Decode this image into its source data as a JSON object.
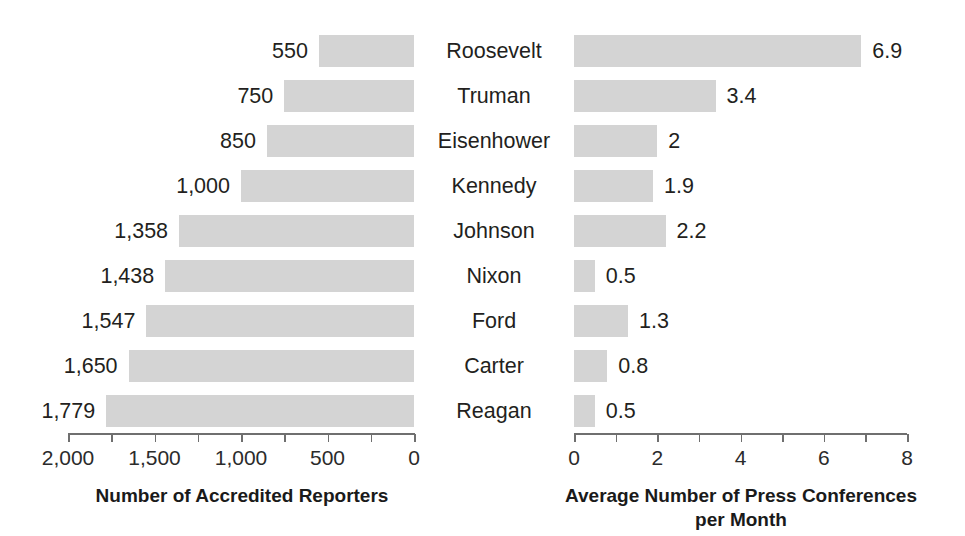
{
  "chart_data": {
    "type": "bar",
    "title": "",
    "orientation": "horizontal",
    "layout": "back-to-back butterfly / tornado, two panels sharing centered category labels",
    "categories": [
      "Roosevelt",
      "Truman",
      "Eisenhower",
      "Kennedy",
      "Johnson",
      "Nixon",
      "Ford",
      "Carter",
      "Reagan"
    ],
    "grid": false,
    "legend": null,
    "bar_color": "#d4d4d4",
    "axis_color": "#6f6f6f",
    "text_color": "#231f20",
    "panels": [
      {
        "id": "accredited-reporters",
        "side": "left",
        "xlabel": "Number of Accredited Reporters",
        "direction": "right-to-left",
        "xlim": [
          2000,
          0
        ],
        "xticks": [
          2000,
          1750,
          1500,
          1250,
          1000,
          750,
          500,
          250,
          0
        ],
        "xtick_labels": [
          "2,000",
          "",
          "1,500",
          "",
          "1,000",
          "",
          "500",
          "",
          "0"
        ],
        "values": [
          550,
          750,
          850,
          1000,
          1358,
          1438,
          1547,
          1650,
          1779
        ],
        "value_labels": [
          "550",
          "750",
          "850",
          "1,000",
          "1,358",
          "1,438",
          "1,547",
          "1,650",
          "1,779"
        ]
      },
      {
        "id": "press-conferences",
        "side": "right",
        "xlabel": "Average Number of Press Conferences per Month",
        "xlabel_line1": "Average Number of Press Conferences",
        "xlabel_line2": "per Month",
        "direction": "left-to-right",
        "xlim": [
          0,
          8
        ],
        "xticks": [
          0,
          1,
          2,
          3,
          4,
          5,
          6,
          7,
          8
        ],
        "xtick_labels": [
          "0",
          "",
          "2",
          "",
          "4",
          "",
          "6",
          "",
          "8"
        ],
        "values": [
          6.9,
          3.4,
          2,
          1.9,
          2.2,
          0.5,
          1.3,
          0.8,
          0.5
        ],
        "value_labels": [
          "6.9",
          "3.4",
          "2",
          "1.9",
          "2.2",
          "0.5",
          "1.3",
          "0.8",
          "0.5"
        ]
      }
    ]
  }
}
